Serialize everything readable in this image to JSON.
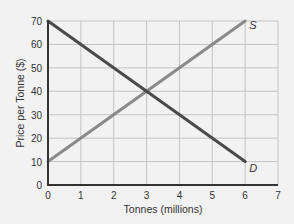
{
  "chart_data": {
    "type": "line",
    "title": "",
    "xlabel": "Tonnes (millions)",
    "ylabel": "Price per Tonne ($)",
    "xlim": [
      0,
      7
    ],
    "ylim": [
      0,
      70
    ],
    "x_ticks": [
      "0",
      "1",
      "2",
      "3",
      "4",
      "5",
      "6",
      "7"
    ],
    "y_ticks": [
      "0",
      "10",
      "20",
      "30",
      "40",
      "50",
      "60",
      "70"
    ],
    "grid": true,
    "series": [
      {
        "name": "S",
        "label": "S",
        "color": "#8a8a8a",
        "x": [
          0,
          6
        ],
        "y": [
          10,
          70
        ]
      },
      {
        "name": "D",
        "label": "D",
        "color": "#4a4a4a",
        "x": [
          0,
          6
        ],
        "y": [
          70,
          10
        ]
      }
    ],
    "equilibrium": {
      "x": 3,
      "y": 40
    }
  }
}
